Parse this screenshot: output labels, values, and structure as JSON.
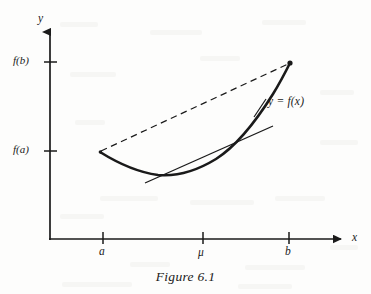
{
  "figure": {
    "caption": "Figure 6.1",
    "background_color": "#fdfdfc",
    "ink_color": "#1a1a1a"
  },
  "axes": {
    "y_axis_label": "y",
    "x_axis_label": "x",
    "origin_px": {
      "x": 50,
      "y": 239
    },
    "y_axis_top_px": 30,
    "x_axis_right_px": 347
  },
  "y_ticks": [
    {
      "label": "f(b)",
      "y_px": 62
    },
    {
      "label": "f(a)",
      "y_px": 151
    }
  ],
  "x_ticks": [
    {
      "label": "a",
      "x_px": 103
    },
    {
      "label": "μ",
      "x_px": 203
    },
    {
      "label": "b",
      "x_px": 289
    }
  ],
  "curve": {
    "label": "y = f(x)",
    "description": "convex function y = f(x) from (a, f(a)) to (b, f(b))",
    "style": "solid-thick",
    "points": [
      {
        "x": 100,
        "y": 152
      },
      {
        "x": 112,
        "y": 158
      },
      {
        "x": 126,
        "y": 166
      },
      {
        "x": 142,
        "y": 172
      },
      {
        "x": 158,
        "y": 175
      },
      {
        "x": 174,
        "y": 175
      },
      {
        "x": 190,
        "y": 172
      },
      {
        "x": 204,
        "y": 166
      },
      {
        "x": 218,
        "y": 157
      },
      {
        "x": 232,
        "y": 146
      },
      {
        "x": 246,
        "y": 131
      },
      {
        "x": 260,
        "y": 113
      },
      {
        "x": 272,
        "y": 96
      },
      {
        "x": 282,
        "y": 79
      },
      {
        "x": 290,
        "y": 63
      }
    ]
  },
  "chord": {
    "name": "secant-chord",
    "style": "dashed",
    "from": {
      "x": 100,
      "y": 152
    },
    "to": {
      "x": 290,
      "y": 63
    }
  },
  "tangent": {
    "name": "tangent-line-at-mu",
    "style": "solid-thin",
    "from": {
      "x": 145,
      "y": 183
    },
    "to": {
      "x": 273,
      "y": 126
    }
  }
}
